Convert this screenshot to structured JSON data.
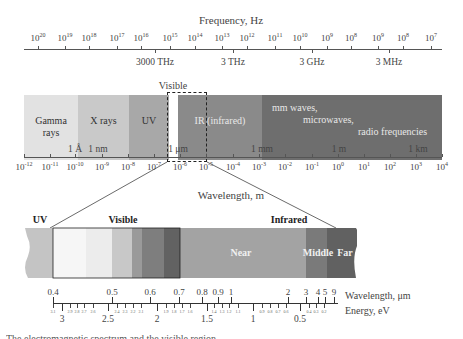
{
  "frequency_axis": {
    "title": "Frequency, Hz",
    "ticks": [
      {
        "x": 38,
        "mant": "10",
        "exp": "20"
      },
      {
        "x": 65,
        "mant": "10",
        "exp": "19"
      },
      {
        "x": 89,
        "mant": "10",
        "exp": "18"
      },
      {
        "x": 117,
        "mant": "10",
        "exp": "17"
      },
      {
        "x": 141,
        "mant": "10",
        "exp": "16"
      },
      {
        "x": 170,
        "mant": "10",
        "exp": "15"
      },
      {
        "x": 195,
        "mant": "10",
        "exp": "14"
      },
      {
        "x": 222,
        "mant": "10",
        "exp": "13"
      },
      {
        "x": 247,
        "mant": "10",
        "exp": "12"
      },
      {
        "x": 275,
        "mant": "10",
        "exp": "11"
      },
      {
        "x": 300,
        "mant": "10",
        "exp": "10"
      },
      {
        "x": 327,
        "mant": "10",
        "exp": "9"
      },
      {
        "x": 351,
        "mant": "10",
        "exp": "8"
      },
      {
        "x": 378,
        "mant": "10",
        "exp": "9"
      },
      {
        "x": 403,
        "mant": "10",
        "exp": "8"
      },
      {
        "x": 431,
        "mant": "10",
        "exp": "7"
      }
    ],
    "named": [
      {
        "x": 155,
        "label": "3000 THz"
      },
      {
        "x": 233,
        "label": "3 THz"
      },
      {
        "x": 312,
        "label": "3 GHz"
      },
      {
        "x": 389,
        "label": "3 MHz"
      }
    ]
  },
  "spectrum": {
    "visible_label": "Visible",
    "bands": [
      {
        "name": "gamma",
        "label_line1": "Gamma",
        "label_line2": "rays",
        "x": 24,
        "w": 54,
        "color": "#e2e2e2"
      },
      {
        "name": "xrays",
        "label_line1": "X rays",
        "label_line2": "",
        "x": 78,
        "w": 51,
        "color": "#c9c9c9"
      },
      {
        "name": "uv",
        "label_line1": "UV",
        "label_line2": "",
        "x": 129,
        "w": 40,
        "color": "#a8a8a8"
      },
      {
        "name": "visible",
        "label_line1": "",
        "label_line2": "",
        "x": 169,
        "w": 9,
        "color": "#ffffff"
      },
      {
        "name": "ir",
        "label_line1": "IR (infrared)",
        "label_line2": "",
        "x": 178,
        "w": 84,
        "color": "#8a8a8a"
      },
      {
        "name": "radio",
        "label_line1": "mm waves,",
        "label_line2": "microwaves,",
        "label_line3": "radio frequencies",
        "x": 262,
        "w": 180,
        "color": "#6e6e6e"
      }
    ],
    "unit_marks": [
      {
        "x": 75,
        "label": "1 Å"
      },
      {
        "x": 98,
        "label": "1 nm"
      },
      {
        "x": 178,
        "label": "1 μm"
      },
      {
        "x": 262,
        "label": "1 mm"
      },
      {
        "x": 339,
        "label": "1 m"
      },
      {
        "x": 418,
        "label": "1 km"
      }
    ]
  },
  "wavelength_axis": {
    "title": "Wavelength, m",
    "ticks": [
      {
        "x": 24,
        "mant": "10",
        "exp": "-12"
      },
      {
        "x": 50,
        "mant": "10",
        "exp": "-11"
      },
      {
        "x": 75,
        "mant": "10",
        "exp": "-10"
      },
      {
        "x": 102,
        "mant": "10",
        "exp": "-9"
      },
      {
        "x": 128,
        "mant": "10",
        "exp": "-8"
      },
      {
        "x": 154,
        "mant": "10",
        "exp": "-7"
      },
      {
        "x": 180,
        "mant": "10",
        "exp": "-6"
      },
      {
        "x": 206,
        "mant": "10",
        "exp": "-5"
      },
      {
        "x": 233,
        "mant": "10",
        "exp": "-4"
      },
      {
        "x": 259,
        "mant": "10",
        "exp": "-3"
      },
      {
        "x": 285,
        "mant": "10",
        "exp": "-2"
      },
      {
        "x": 312,
        "mant": "10",
        "exp": "-1"
      },
      {
        "x": 338,
        "mant": "10",
        "exp": "0"
      },
      {
        "x": 364,
        "mant": "10",
        "exp": "1"
      },
      {
        "x": 390,
        "mant": "10",
        "exp": "2"
      },
      {
        "x": 416,
        "mant": "10",
        "exp": "3"
      },
      {
        "x": 442,
        "mant": "10",
        "exp": "4"
      }
    ]
  },
  "detail": {
    "headers": [
      {
        "x": 40,
        "label": "UV"
      },
      {
        "x": 123,
        "label": "Visible"
      },
      {
        "x": 289,
        "label": "Infrared"
      }
    ],
    "bands": [
      {
        "name": "uv-edge",
        "x": 25,
        "w": 28,
        "color": "#c4c4c4"
      },
      {
        "name": "violet",
        "x": 53,
        "w": 33,
        "color": "#f6f6f6"
      },
      {
        "name": "blue",
        "x": 86,
        "w": 26,
        "color": "#ececec"
      },
      {
        "name": "green",
        "x": 112,
        "w": 20,
        "color": "#c8c8c8"
      },
      {
        "name": "yellow",
        "x": 132,
        "w": 10,
        "color": "#9a9a9a"
      },
      {
        "name": "orange",
        "x": 142,
        "w": 22,
        "color": "#7e7e7e"
      },
      {
        "name": "red",
        "x": 164,
        "w": 16,
        "color": "#626262"
      },
      {
        "name": "near",
        "x": 180,
        "w": 126,
        "color": "#a3a3a3"
      },
      {
        "name": "middle",
        "x": 306,
        "w": 21,
        "color": "#7a7a7a"
      },
      {
        "name": "far",
        "x": 327,
        "w": 30,
        "color": "#616161"
      }
    ],
    "band_labels": [
      {
        "x": 241,
        "label": "Near"
      },
      {
        "x": 318,
        "label": "Middle"
      },
      {
        "x": 345,
        "label": "Far"
      }
    ],
    "wavelength_um": {
      "title": "Wavelength, μm",
      "ticks": [
        {
          "x": 53,
          "label": "0.4"
        },
        {
          "x": 112,
          "label": "0.5"
        },
        {
          "x": 150,
          "label": "0.6"
        },
        {
          "x": 179,
          "label": "0.7"
        },
        {
          "x": 202,
          "label": "0.8"
        },
        {
          "x": 218,
          "label": "0.9"
        },
        {
          "x": 231,
          "label": "1"
        },
        {
          "x": 288,
          "label": "2"
        },
        {
          "x": 306,
          "label": "3"
        },
        {
          "x": 318,
          "label": "4"
        },
        {
          "x": 325,
          "label": "5"
        },
        {
          "x": 334,
          "label": "9"
        }
      ]
    },
    "energy_ev": {
      "title": "Energy, eV",
      "major": [
        {
          "x": 62,
          "label": "3"
        },
        {
          "x": 108,
          "label": "2.5"
        },
        {
          "x": 157,
          "label": "2"
        },
        {
          "x": 207,
          "label": "1.5"
        },
        {
          "x": 253,
          "label": "1"
        },
        {
          "x": 300,
          "label": "0.5"
        }
      ],
      "minor": [
        {
          "x": 53,
          "label": "3.1"
        },
        {
          "x": 70,
          "label": "2.9"
        },
        {
          "x": 77,
          "label": "2.8"
        },
        {
          "x": 84,
          "label": "2.7"
        },
        {
          "x": 93,
          "label": "2.6"
        },
        {
          "x": 117,
          "label": "2.4"
        },
        {
          "x": 125,
          "label": "2.3"
        },
        {
          "x": 133,
          "label": "2.2"
        },
        {
          "x": 141,
          "label": "2.1"
        },
        {
          "x": 166,
          "label": "1.9"
        },
        {
          "x": 174,
          "label": "1.8"
        },
        {
          "x": 182,
          "label": "1.7"
        },
        {
          "x": 190,
          "label": "1.6"
        },
        {
          "x": 214,
          "label": "1.4"
        },
        {
          "x": 222,
          "label": "1.3"
        },
        {
          "x": 229,
          "label": "1.2"
        },
        {
          "x": 238,
          "label": "1.1"
        },
        {
          "x": 262,
          "label": "0.9"
        },
        {
          "x": 270,
          "label": "0.8"
        },
        {
          "x": 278,
          "label": "0.7"
        },
        {
          "x": 286,
          "label": "0.6"
        },
        {
          "x": 309,
          "label": "0.4"
        },
        {
          "x": 316,
          "label": "0.3"
        },
        {
          "x": 324,
          "label": "0.2"
        }
      ]
    }
  },
  "caption": "The electromagnetic spectrum and the visible region"
}
